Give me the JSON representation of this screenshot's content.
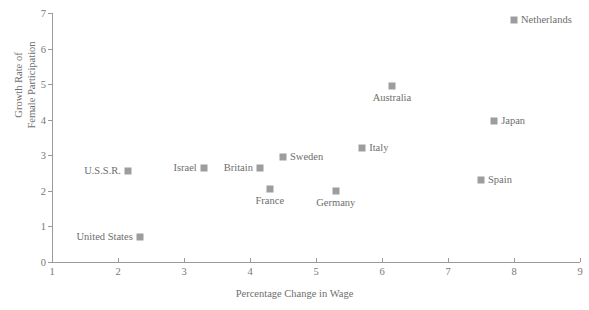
{
  "chart_data": {
    "type": "scatter",
    "title": "",
    "xlabel": "Percentage Change in Wage",
    "ylabel": "Growth Rate of Female Participation",
    "ylabel_lines": [
      "Growth Rate of",
      "Female Participation"
    ],
    "xlim": [
      1,
      9
    ],
    "ylim": [
      0,
      7
    ],
    "xticks": [
      "1",
      "2",
      "3",
      "4",
      "5",
      "6",
      "7",
      "8",
      "9"
    ],
    "yticks": [
      "0",
      "1",
      "2",
      "3",
      "4",
      "5",
      "6",
      "7"
    ],
    "grid": false,
    "legend": "none",
    "marker_color": "#9d9d9d",
    "axis_color": "#9a9a9a",
    "text_color": "#6e6e6e",
    "points": [
      {
        "label": "Netherlands",
        "x": 8.0,
        "y": 6.8,
        "label_side": "right"
      },
      {
        "label": "Australia",
        "x": 6.15,
        "y": 4.95,
        "label_side": "below"
      },
      {
        "label": "Japan",
        "x": 7.7,
        "y": 3.95,
        "label_side": "right"
      },
      {
        "label": "Italy",
        "x": 5.7,
        "y": 3.2,
        "label_side": "right"
      },
      {
        "label": "Sweden",
        "x": 4.5,
        "y": 2.95,
        "label_side": "right"
      },
      {
        "label": "Britain",
        "x": 4.15,
        "y": 2.65,
        "label_side": "left"
      },
      {
        "label": "Israel",
        "x": 3.3,
        "y": 2.65,
        "label_side": "left"
      },
      {
        "label": "U.S.S.R.",
        "x": 2.15,
        "y": 2.55,
        "label_side": "left"
      },
      {
        "label": "Spain",
        "x": 7.5,
        "y": 2.3,
        "label_side": "right"
      },
      {
        "label": "France",
        "x": 4.3,
        "y": 2.05,
        "label_side": "below"
      },
      {
        "label": "Germany",
        "x": 5.3,
        "y": 2.0,
        "label_side": "below"
      },
      {
        "label": "United States",
        "x": 2.33,
        "y": 0.7,
        "label_side": "left"
      }
    ]
  }
}
